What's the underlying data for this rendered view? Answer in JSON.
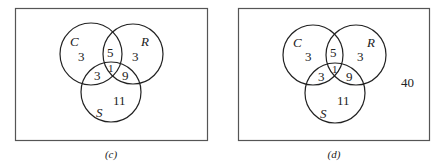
{
  "diagrams": [
    {
      "caption": "(c)",
      "sets": {
        "C": "C",
        "R": "R",
        "S": "S"
      },
      "regions": {
        "C_only": "3",
        "R_only": "3",
        "S_only": "11",
        "C_R": "5",
        "C_S": "3",
        "R_S": "9",
        "C_R_S": "1"
      }
    },
    {
      "caption": "(d)",
      "sets": {
        "C": "C",
        "R": "R",
        "S": "S"
      },
      "regions": {
        "C_only": "3",
        "R_only": "3",
        "S_only": "11",
        "C_R": "5",
        "C_S": "3",
        "R_S": "9",
        "C_R_S": "1",
        "outside": "40"
      }
    }
  ]
}
